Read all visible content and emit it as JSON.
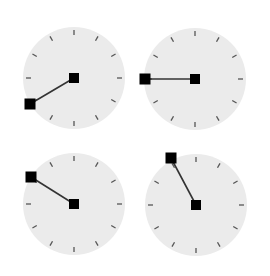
{
  "colors": {
    "background": "#ffffff",
    "face": "#ebebeb",
    "tick": "#555555",
    "hand": "#333333",
    "knob": "#000000"
  },
  "clocks": [
    {
      "id": "clock-1",
      "center": [
        74,
        78
      ],
      "radius": 51,
      "end": [
        30,
        104
      ]
    },
    {
      "id": "clock-2",
      "center": [
        195,
        79
      ],
      "radius": 51,
      "end": [
        145,
        79
      ]
    },
    {
      "id": "clock-3",
      "center": [
        74,
        204
      ],
      "radius": 51,
      "end": [
        31,
        177
      ]
    },
    {
      "id": "clock-4",
      "center": [
        196,
        205
      ],
      "radius": 51,
      "end": [
        171,
        158
      ]
    }
  ],
  "tick_count": 12,
  "knob_size": 10
}
